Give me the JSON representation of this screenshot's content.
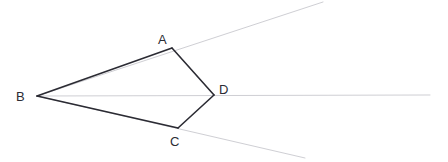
{
  "figure": {
    "type": "geometry-diagram",
    "width": 448,
    "height": 162,
    "background_color": "#ffffff",
    "stroke_color": "#2b2b33",
    "ray_color": "#cfcfd4",
    "stroke_width": 1.6,
    "ray_width": 1,
    "label_color": "#2c2c34",
    "label_font_size": 13
  },
  "points": {
    "A": {
      "label": "A",
      "x": 172,
      "y": 48,
      "label_x": 158,
      "label_y": 44
    },
    "B": {
      "label": "B",
      "x": 37,
      "y": 96,
      "label_x": 16,
      "label_y": 101
    },
    "C": {
      "label": "C",
      "x": 178,
      "y": 128,
      "label_x": 170,
      "label_y": 146
    },
    "D": {
      "label": "D",
      "x": 214,
      "y": 95,
      "label_x": 219,
      "label_y": 94
    }
  },
  "segments": [
    {
      "name": "BA",
      "from": "B",
      "to": "A",
      "x1": 37,
      "y1": 96,
      "x2": 172,
      "y2": 48,
      "style": "solid"
    },
    {
      "name": "AD",
      "from": "A",
      "to": "D",
      "x1": 172,
      "y1": 48,
      "x2": 214,
      "y2": 95,
      "style": "solid"
    },
    {
      "name": "DC",
      "from": "D",
      "to": "C",
      "x1": 214,
      "y1": 95,
      "x2": 178,
      "y2": 128,
      "style": "solid"
    },
    {
      "name": "CB",
      "from": "C",
      "to": "B",
      "x1": 178,
      "y1": 128,
      "x2": 37,
      "y2": 96,
      "style": "solid"
    }
  ],
  "rays": [
    {
      "name": "ray-BA-extended",
      "through": "A",
      "x1": 37,
      "y1": 96,
      "x2": 323,
      "y2": 2,
      "style": "light"
    },
    {
      "name": "ray-BC-extended",
      "through": "C",
      "x1": 37,
      "y1": 96,
      "x2": 305,
      "y2": 158,
      "style": "light"
    },
    {
      "name": "ray-BD-horizontal",
      "through": "D",
      "x1": 37,
      "y1": 96,
      "x2": 430,
      "y2": 95,
      "style": "light"
    }
  ]
}
